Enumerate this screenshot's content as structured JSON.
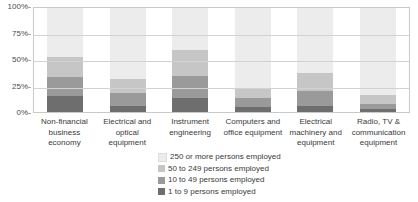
{
  "chart_data": {
    "type": "bar",
    "stacked": true,
    "stack_total": 100,
    "title": "",
    "subtitle": "",
    "xlabel": "",
    "ylabel": "",
    "ylim": [
      0,
      100
    ],
    "ytick_labels": [
      "0%",
      "25%",
      "50%",
      "75%",
      "100%"
    ],
    "ytick_values": [
      0,
      25,
      50,
      75,
      100
    ],
    "grid": true,
    "legend_position": "bottom-center",
    "categories": [
      "Non-financial business economy",
      "Electrical and optical equipment",
      "Instrument engineering",
      "Computers and office equipment",
      "Electrical machinery and equipment",
      "Radio, TV & communication equipment"
    ],
    "category_lines": [
      [
        "Non-financial",
        "business",
        "economy"
      ],
      [
        "Electrical and",
        "optical",
        "equipment"
      ],
      [
        "Instrument",
        "engineering"
      ],
      [
        "Computers and",
        "office equipment"
      ],
      [
        "Electrical",
        "machinery and",
        "equipment"
      ],
      [
        "Radio, TV &",
        "communication",
        "equipment"
      ]
    ],
    "series": [
      {
        "name": "250 or more persons employed",
        "color": "#ececec",
        "values": [
          47,
          68,
          40,
          77,
          62,
          84
        ]
      },
      {
        "name": "50 to 249 persons employed",
        "color": "#c6c6c6",
        "values": [
          19,
          14,
          25,
          10,
          18,
          8
        ]
      },
      {
        "name": "10 to 49 persons employed",
        "color": "#9a9a9a",
        "values": [
          19,
          12,
          22,
          8,
          14,
          5
        ]
      },
      {
        "name": "1 to 9 persons employed",
        "color": "#6e6e6e",
        "values": [
          15,
          6,
          13,
          5,
          6,
          3
        ]
      }
    ]
  },
  "legend": {
    "items": [
      {
        "label": "250 or more persons employed",
        "color": "#ececec"
      },
      {
        "label": "50 to 249 persons employed",
        "color": "#c6c6c6"
      },
      {
        "label": "10 to 49 persons employed",
        "color": "#9a9a9a"
      },
      {
        "label": "1 to 9 persons employed",
        "color": "#6e6e6e"
      }
    ]
  },
  "colors": {
    "background": "#ffffff",
    "gridline": "#d2d2d2",
    "axis": "#c9c9c9",
    "text": "#3a3a3a"
  }
}
